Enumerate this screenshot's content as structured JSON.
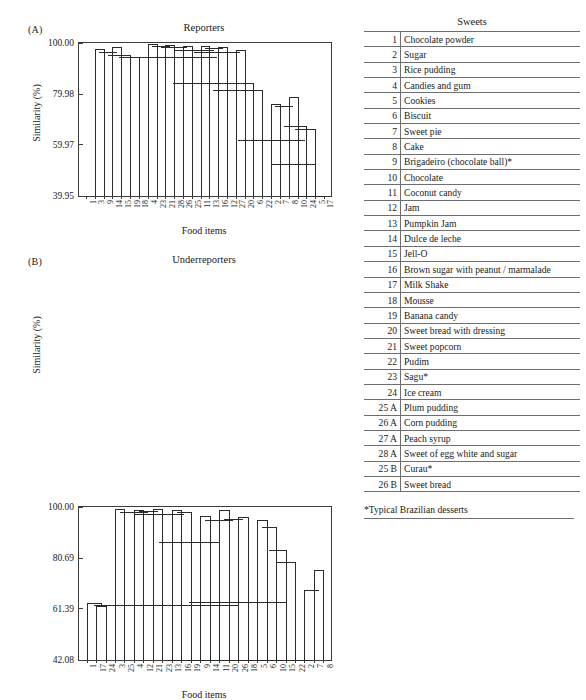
{
  "figure": {
    "legend_header": "Sweets",
    "footnote": "*Typical Brazilian desserts"
  },
  "panels": [
    {
      "tag": "(A)",
      "title": "Reporters",
      "ylabel": "Similarity (%)",
      "xlabel": "Food items"
    },
    {
      "tag": "(B)",
      "title": "Underreporters",
      "ylabel": "Similarity (%)",
      "xlabel": "Food items"
    }
  ],
  "sweets": [
    {
      "code": "1",
      "name": "Chocolate powder"
    },
    {
      "code": "2",
      "name": "Sugar"
    },
    {
      "code": "3",
      "name": "Rice pudding"
    },
    {
      "code": "4",
      "name": "Candies and gum"
    },
    {
      "code": "5",
      "name": "Cookies"
    },
    {
      "code": "6",
      "name": "Biscuit"
    },
    {
      "code": "7",
      "name": "Sweet pie"
    },
    {
      "code": "8",
      "name": "Cake"
    },
    {
      "code": "9",
      "name": "Brigadeiro (chocolate ball)*"
    },
    {
      "code": "10",
      "name": "Chocolate"
    },
    {
      "code": "11",
      "name": "Coconut candy"
    },
    {
      "code": "12",
      "name": "Jam"
    },
    {
      "code": "13",
      "name": "Pumpkin Jam"
    },
    {
      "code": "14",
      "name": "Dulce de leche"
    },
    {
      "code": "15",
      "name": "Jell-O"
    },
    {
      "code": "16",
      "name": "Brown sugar with peanut / marmalade"
    },
    {
      "code": "17",
      "name": "Milk Shake"
    },
    {
      "code": "18",
      "name": "Mousse"
    },
    {
      "code": "19",
      "name": "Banana candy"
    },
    {
      "code": "20",
      "name": "Sweet bread with dressing"
    },
    {
      "code": "21",
      "name": "Sweet popcorn"
    },
    {
      "code": "22",
      "name": "Pudim"
    },
    {
      "code": "23",
      "name": "Sagu*"
    },
    {
      "code": "24",
      "name": "Ice cream"
    },
    {
      "code": "25 A",
      "name": "Plum pudding"
    },
    {
      "code": "26 A",
      "name": "Corn pudding"
    },
    {
      "code": "27 A",
      "name": "Peach syrup"
    },
    {
      "code": "28 A",
      "name": "Sweet of egg white and sugar"
    },
    {
      "code": "25 B",
      "name": "Curau*"
    },
    {
      "code": "26 B",
      "name": "Sweet bread"
    }
  ],
  "chart_data": [
    {
      "type": "dendrogram",
      "title": "Reporters",
      "xlabel": "Food items",
      "ylabel": "Similarity (%)",
      "yticks": [
        "39.95",
        "59.97",
        "79.98",
        "100.00"
      ],
      "ytick_values": [
        39.95,
        59.97,
        79.98,
        100.0
      ],
      "ylim": [
        39.95,
        100.0
      ],
      "y_axis_inverted": true,
      "leaf_order": [
        "1",
        "3",
        "9",
        "14",
        "15",
        "19",
        "18",
        "4",
        "23",
        "21",
        "28",
        "22",
        "26",
        "25",
        "11",
        "13",
        "16",
        "12",
        "27",
        "20",
        "6",
        "22",
        "2",
        "7",
        "8",
        "10",
        "24",
        "5",
        "17"
      ],
      "leaves": [
        "1",
        "3",
        "9",
        "14",
        "15",
        "19",
        "18",
        "4",
        "23",
        "21",
        "28",
        "26",
        "25",
        "11",
        "13",
        "16",
        "12",
        "27",
        "20",
        "6",
        "22",
        "2",
        "7",
        "8",
        "10",
        "24",
        "5",
        "17"
      ],
      "merges": [
        {
          "left": "3",
          "right": "9",
          "similarity": 97.7
        },
        {
          "left": "14",
          "right": "15",
          "similarity": 98.5
        },
        {
          "left": "[3,9]",
          "right": "[14,15]",
          "similarity": 96.6
        },
        {
          "left": "[3,9,14,15]",
          "right": "19",
          "similarity": 95.9
        },
        {
          "left": "[...]",
          "right": "18",
          "similarity": 95.6
        },
        {
          "left": "4",
          "right": "23",
          "similarity": 99.5
        },
        {
          "left": "21",
          "right": "28",
          "similarity": 99.1
        },
        {
          "left": "26",
          "right": "25",
          "similarity": 98.9
        },
        {
          "left": "11",
          "right": "13",
          "similarity": 99.0
        },
        {
          "left": "16",
          "right": "12",
          "similarity": 98.6
        },
        {
          "left": "27",
          "right": "20",
          "similarity": 97.6
        },
        {
          "left": "group-left",
          "right": "group-mid",
          "similarity": 95.4
        },
        {
          "left": "mid-cluster",
          "right": "6",
          "similarity": 84.2
        },
        {
          "left": "22",
          "right": "cluster",
          "similarity": 81.5
        },
        {
          "left": "2",
          "right": "7",
          "similarity": 76.0
        },
        {
          "left": "8",
          "right": "10",
          "similarity": 79.5
        },
        {
          "left": "24",
          "right": "5",
          "similarity": 67.5
        },
        {
          "left": "big-left",
          "right": "big-right",
          "similarity": 61.6
        },
        {
          "left": "upper",
          "right": "upper2",
          "similarity": 52.5
        },
        {
          "left": "root-left",
          "right": "17",
          "similarity": 39.95
        }
      ]
    },
    {
      "type": "dendrogram",
      "title": "Underreporters",
      "xlabel": "Food items",
      "ylabel": "Similarity (%)",
      "yticks": [
        "42.08",
        "61.39",
        "80.69",
        "100.00"
      ],
      "ytick_values": [
        42.08,
        61.39,
        80.69,
        100.0
      ],
      "ylim": [
        42.08,
        100.0
      ],
      "y_axis_inverted": true,
      "leaves": [
        "1",
        "17",
        "24",
        "3",
        "25",
        "4",
        "12",
        "21",
        "23",
        "13",
        "16",
        "19",
        "9",
        "14",
        "11",
        "20",
        "26",
        "18",
        "5",
        "6",
        "10",
        "15",
        "22",
        "2",
        "7",
        "8"
      ],
      "merges": [
        {
          "left": "17",
          "right": "24",
          "similarity": 62.0
        },
        {
          "left": "1",
          "right": "[17,24]",
          "similarity": 63.0
        },
        {
          "left": "3",
          "right": "25",
          "similarity": 99.3
        },
        {
          "left": "4",
          "right": "12",
          "similarity": 98.8
        },
        {
          "left": "21",
          "right": "23",
          "similarity": 99.0
        },
        {
          "left": "13",
          "right": "16",
          "similarity": 98.6
        },
        {
          "left": "19",
          "right": "cluster",
          "similarity": 98.4
        },
        {
          "left": "9",
          "right": "14",
          "similarity": 96.5
        },
        {
          "left": "11",
          "right": "20",
          "similarity": 98.8
        },
        {
          "left": "26",
          "right": "18",
          "similarity": 96.2
        },
        {
          "left": "mid",
          "right": "mid2",
          "similarity": 86.8
        },
        {
          "left": "5",
          "right": "6",
          "similarity": 95.0
        },
        {
          "left": "10",
          "right": "15",
          "similarity": 88.5
        },
        {
          "left": "[10,15]",
          "right": "22",
          "similarity": 79.3
        },
        {
          "left": "2",
          "right": "7",
          "similarity": 70.5
        },
        {
          "left": "[2,7]",
          "right": "8",
          "similarity": 75.5
        },
        {
          "left": "left-group",
          "right": "right-group",
          "similarity": 63.5
        },
        {
          "left": "root-left",
          "right": "root-right",
          "similarity": 42.08
        }
      ]
    }
  ]
}
